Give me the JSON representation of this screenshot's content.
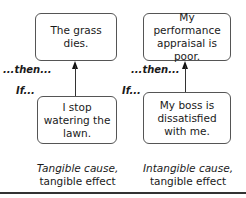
{
  "left": {
    "effect": "The grass dies.",
    "cause": "I stop watering the lawn.",
    "then_label": "...then...",
    "if_label": "If...",
    "caption_line1": "Tangible cause,",
    "caption_line2": "tangible effect"
  },
  "right": {
    "effect": "My performance appraisal is poor.",
    "cause": "My boss is dissatisfied with me.",
    "then_label": "...then...",
    "if_label": "If...",
    "caption_line1": "Intangible cause,",
    "caption_line2": "tangible effect"
  }
}
